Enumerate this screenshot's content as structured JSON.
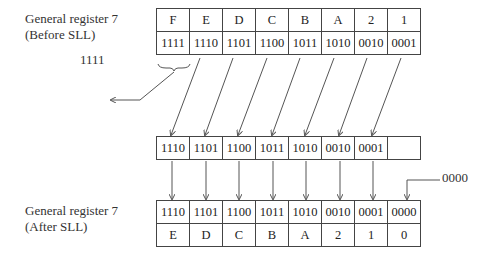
{
  "before": {
    "label_line1": "General register 7",
    "label_line2": "(Before SLL)",
    "hex": [
      "F",
      "E",
      "D",
      "C",
      "B",
      "A",
      "2",
      "1"
    ],
    "bits": [
      "1111",
      "1110",
      "1101",
      "1100",
      "1011",
      "1010",
      "0010",
      "0001"
    ]
  },
  "shifted_out": "1111",
  "intermediate": {
    "bits": [
      "1110",
      "1101",
      "1100",
      "1011",
      "1010",
      "0010",
      "0001",
      ""
    ]
  },
  "shifted_in": "0000",
  "after": {
    "label_line1": "General register 7",
    "label_line2": "(After SLL)",
    "bits": [
      "1110",
      "1101",
      "1100",
      "1011",
      "1010",
      "0010",
      "0001",
      "0000"
    ],
    "hex": [
      "E",
      "D",
      "C",
      "B",
      "A",
      "2",
      "1",
      "0"
    ]
  }
}
